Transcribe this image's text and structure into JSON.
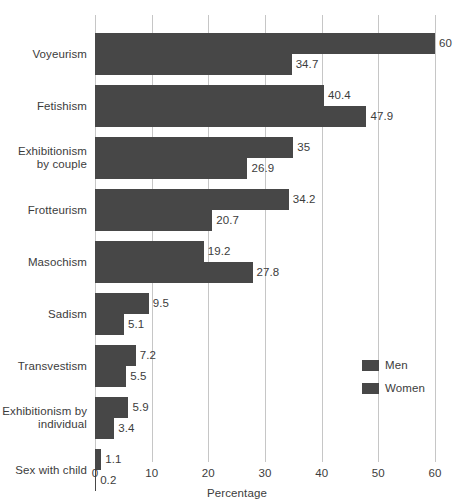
{
  "chart_data": {
    "type": "bar",
    "orientation": "horizontal",
    "title": "",
    "xlabel": "Percentage",
    "ylabel": "",
    "xlim": [
      0,
      60
    ],
    "xticks": [
      0,
      10,
      20,
      30,
      40,
      50,
      60
    ],
    "xtick_labels": [
      "0",
      "10",
      "20",
      "30",
      "40",
      "50",
      "60"
    ],
    "grid": "vertical",
    "legend_position": "center-right",
    "bar_color": "#474747",
    "gridline_color": "#c6c6c6",
    "background_color": "#ffffff",
    "categories": [
      "Voyeurism",
      "Fetishism",
      "Exhibitionism by couple",
      "Frotteurism",
      "Masochism",
      "Sadism",
      "Transvestism",
      "Exhibitionism by individual",
      "Sex with child"
    ],
    "category_label_lines": [
      [
        "Voyeurism"
      ],
      [
        "Fetishism"
      ],
      [
        "Exhibitionism",
        "by couple"
      ],
      [
        "Frotteurism"
      ],
      [
        "Masochism"
      ],
      [
        "Sadism"
      ],
      [
        "Transvestism"
      ],
      [
        "Exhibitionism by",
        "individual"
      ],
      [
        "Sex with child"
      ]
    ],
    "series": [
      {
        "name": "Men",
        "values": [
          60,
          40.4,
          35,
          34.2,
          19.2,
          9.5,
          7.2,
          5.9,
          1.1
        ],
        "value_labels": [
          "60",
          "40.4",
          "35",
          "34.2",
          "19.2",
          "9.5",
          "7.2",
          "5.9",
          "1.1"
        ]
      },
      {
        "name": "Women",
        "values": [
          34.7,
          47.9,
          26.9,
          20.7,
          27.8,
          5.1,
          5.5,
          3.4,
          0.2
        ],
        "value_labels": [
          "34.7",
          "47.9",
          "26.9",
          "20.7",
          "27.8",
          "5.1",
          "5.5",
          "3.4",
          "0.2"
        ]
      }
    ],
    "legend": [
      {
        "label": "Men",
        "color": "#474747"
      },
      {
        "label": "Women",
        "color": "#474747"
      }
    ]
  }
}
